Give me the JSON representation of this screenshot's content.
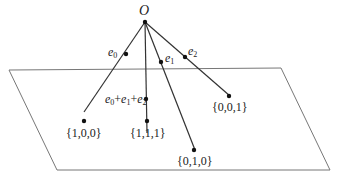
{
  "diagram": {
    "origin": {
      "label": "O",
      "x": 145,
      "y": 22
    },
    "plane": {
      "points": [
        [
          9,
          70
        ],
        [
          281,
          68
        ],
        [
          330,
          170
        ],
        [
          57,
          170
        ]
      ],
      "stroke": "#777777"
    },
    "vectors": [
      {
        "id": "e0",
        "label_base": "e",
        "label_sub": "0",
        "mid": [
          78,
          52
        ],
        "end": [
          84,
          112
        ],
        "end_label": "{1,0,0}"
      },
      {
        "id": "e1e2e0",
        "label_base": "e",
        "label_sub": "0",
        "mid": [
          147,
          110
        ],
        "end": [
          147,
          133
        ],
        "end_label": "{1,1,1}",
        "sum_label": "e0+e1+e2"
      },
      {
        "id": "e1",
        "label_base": "e",
        "label_sub": "1",
        "mid": [
          161,
          57
        ],
        "end": [
          195,
          150
        ],
        "end_label": "{0,1,0}"
      },
      {
        "id": "e2",
        "label_base": "e",
        "label_sub": "2",
        "mid": [
          185,
          51
        ],
        "end": [
          230,
          96
        ],
        "end_label": "{0,0,1}"
      }
    ],
    "labels": {
      "origin": "O",
      "e0": "e",
      "e0_sub": "0",
      "e1": "e",
      "e1_sub": "1",
      "e2": "e",
      "e2_sub": "2",
      "sum_a": "e",
      "sum_a_sub": "0",
      "plus1": "+",
      "sum_b": "e",
      "sum_b_sub": "1",
      "plus2": "+",
      "sum_c": "e",
      "sum_c_sub": "2",
      "p100": "{1,0,0}",
      "p111": "{1,1,1}",
      "p010": "{0,1,0}",
      "p001": "{0,0,1}"
    },
    "colors": {
      "line": "#333333",
      "plane": "#777777",
      "dot": "#111111"
    }
  }
}
